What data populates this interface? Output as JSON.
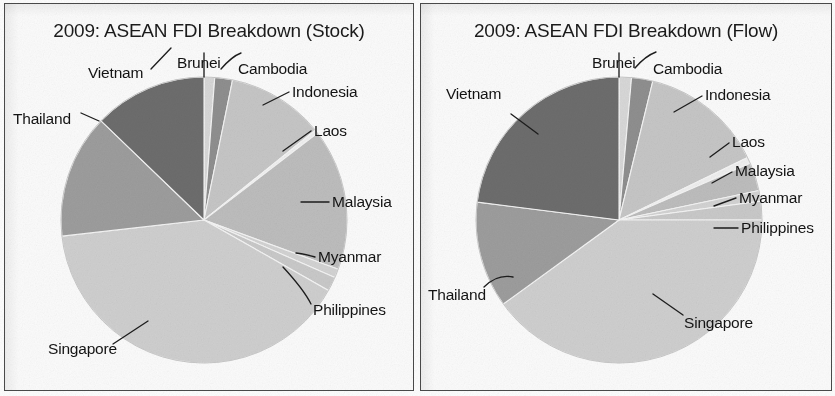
{
  "figure": {
    "background_color": "#fdfdfd",
    "border_color": "#4a4a4a",
    "text_color": "#141414"
  },
  "panels": [
    {
      "key": "stock",
      "title": "2009: ASEAN FDI Breakdown (Stock)"
    },
    {
      "key": "flow",
      "title": "2009: ASEAN FDI Breakdown (Flow)"
    }
  ],
  "labels": {
    "brunei": "Brunei",
    "cambodia": "Cambodia",
    "indonesia": "Indonesia",
    "laos": "Laos",
    "malaysia": "Malaysia",
    "myanmar": "Myanmar",
    "philippines": "Philippines",
    "singapore": "Singapore",
    "thailand": "Thailand",
    "vietnam": "Vietnam"
  },
  "slice_colors": {
    "brunei": "#d8d8d8",
    "cambodia": "#8f8f8f",
    "indonesia": "#c6c6c6",
    "laos": "#efefef",
    "malaysia": "#bdbdbd",
    "myanmar": "#d3d3d3",
    "philippines": "#c9c9c9",
    "singapore": "#cfcfcf",
    "thailand": "#9d9d9d",
    "vietnam": "#6d6d6d"
  },
  "chart_data": [
    {
      "type": "pie",
      "title": "2009: ASEAN FDI Breakdown (Stock)",
      "xlabel": "",
      "ylabel": "",
      "legend": "none",
      "labels_position": "outside-with-leader-lines",
      "start_angle_deg": 90,
      "direction": "clockwise",
      "categories": [
        "Brunei",
        "Cambodia",
        "Indonesia",
        "Laos",
        "Malaysia",
        "Myanmar",
        "Philippines",
        "Singapore",
        "Thailand",
        "Vietnam"
      ],
      "values": [
        1.2,
        2.0,
        11.0,
        0.4,
        16.0,
        1.0,
        1.6,
        40.0,
        14.0,
        12.8
      ],
      "unit": "percent of total ASEAN FDI stock",
      "annotations": [
        "Singapore is by far the largest share",
        "Laos is a near-zero sliver"
      ]
    },
    {
      "type": "pie",
      "title": "2009: ASEAN FDI Breakdown (Flow)",
      "xlabel": "",
      "ylabel": "",
      "legend": "none",
      "labels_position": "outside-with-leader-lines",
      "start_angle_deg": 90,
      "direction": "clockwise",
      "categories": [
        "Brunei",
        "Cambodia",
        "Indonesia",
        "Laos",
        "Malaysia",
        "Myanmar",
        "Philippines",
        "Singapore",
        "Thailand",
        "Vietnam"
      ],
      "values": [
        1.4,
        2.4,
        14.0,
        0.7,
        3.2,
        1.2,
        2.1,
        40.0,
        12.0,
        23.0
      ],
      "unit": "percent of total ASEAN FDI flow",
      "annotations": [
        "Singapore again the largest share",
        "Vietnam share much larger than in the Stock chart"
      ]
    }
  ]
}
